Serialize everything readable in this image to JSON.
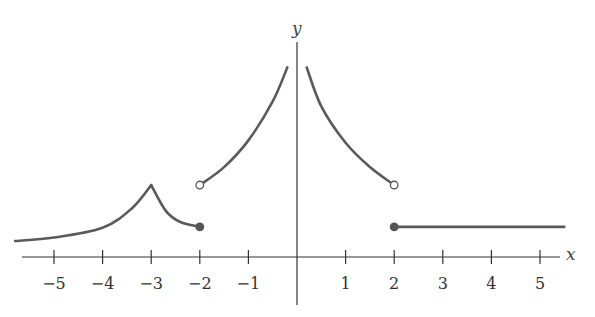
{
  "chart_data": {
    "type": "line",
    "title": "",
    "xlabel": "x",
    "ylabel": "y",
    "xlim": [
      -5.8,
      5.5
    ],
    "x_ticks": [
      -5,
      -4,
      -3,
      -2,
      -1,
      1,
      2,
      3,
      4,
      5
    ],
    "x_tick_labels": [
      "−5",
      "−4",
      "−3",
      "−2",
      "−1",
      "1",
      "2",
      "3",
      "4",
      "5"
    ],
    "y_ticks": [],
    "grid": false,
    "legend": null,
    "pieces": [
      {
        "name": "left tail rising to cusp",
        "domain": [
          -5.8,
          -3
        ],
        "points": [
          [
            -5.8,
            0.33
          ],
          [
            -5,
            0.4
          ],
          [
            -4,
            0.6
          ],
          [
            -3.4,
            1.0
          ],
          [
            -3,
            1.48
          ]
        ]
      },
      {
        "name": "cusp decreasing to closed point",
        "domain": [
          -3,
          -2
        ],
        "points": [
          [
            -3,
            1.48
          ],
          [
            -2.7,
            0.95
          ],
          [
            -2.4,
            0.72
          ],
          [
            -2,
            0.62
          ]
        ],
        "endpoint": {
          "x": -2,
          "y": 0.62,
          "type": "closed"
        }
      },
      {
        "name": "increasing branch toward y-axis",
        "domain": [
          -2,
          -0.2
        ],
        "start": {
          "x": -2,
          "y": 1.48,
          "type": "open"
        },
        "points": [
          [
            -2,
            1.48
          ],
          [
            -1.5,
            1.85
          ],
          [
            -1,
            2.4
          ],
          [
            -0.5,
            3.2
          ],
          [
            -0.2,
            3.9
          ]
        ],
        "asymptote": "x=0"
      },
      {
        "name": "decreasing branch from y-axis",
        "domain": [
          0.2,
          2
        ],
        "points": [
          [
            0.2,
            3.9
          ],
          [
            0.5,
            3.1
          ],
          [
            1,
            2.35
          ],
          [
            1.5,
            1.85
          ],
          [
            2,
            1.48
          ]
        ],
        "endpoint": {
          "x": 2,
          "y": 1.48,
          "type": "open"
        }
      },
      {
        "name": "constant segment",
        "domain": [
          2,
          5.5
        ],
        "start": {
          "x": 2,
          "y": 0.62,
          "type": "closed"
        },
        "points": [
          [
            2,
            0.62
          ],
          [
            5.5,
            0.62
          ]
        ]
      }
    ],
    "annotations": [
      "vertical asymptote at x = 0",
      "cusp at x = -3",
      "jump discontinuities at x = -2 and x = 2"
    ]
  },
  "axes": {
    "x_name": "x",
    "y_name": "y"
  },
  "colors": {
    "curve": "#595959",
    "axis": "#333333",
    "text": "#333333"
  }
}
